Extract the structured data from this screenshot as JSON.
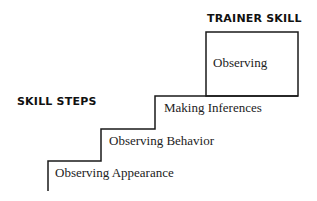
{
  "diagram": {
    "trainer_header": "TRAINER SKILL",
    "steps_header": "SKILL STEPS",
    "trainer_box_label": "Observing",
    "steps": [
      {
        "label": "Observing Appearance"
      },
      {
        "label": "Observing Behavior"
      },
      {
        "label": "Making Inferences"
      }
    ],
    "line_color": "#1a1a1a"
  }
}
